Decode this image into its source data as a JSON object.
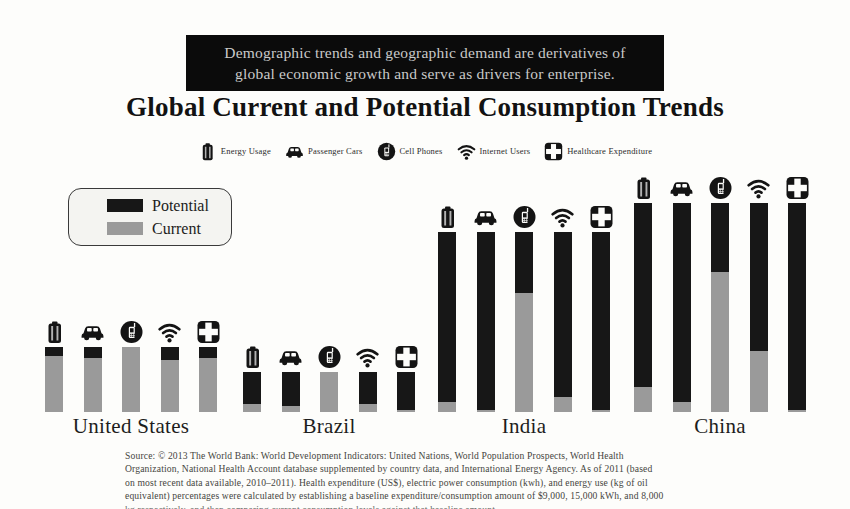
{
  "banner": {
    "line1": "Demographic trends and geographic demand are derivatives of",
    "line2": "global economic growth and serve as drivers for enterprise."
  },
  "title": "Global Current and Potential Consumption Trends",
  "icon_legend": {
    "items": [
      {
        "icon": "energy",
        "label": "Energy Usage"
      },
      {
        "icon": "car",
        "label": "Passenger Cars"
      },
      {
        "icon": "phone",
        "label": "Cell Phones"
      },
      {
        "icon": "wifi",
        "label": "Internet Users"
      },
      {
        "icon": "health",
        "label": "Healthcare Expenditure"
      }
    ]
  },
  "legend": {
    "items": [
      {
        "key": "potential",
        "label": "Potential",
        "color": "#171717"
      },
      {
        "key": "current",
        "label": "Current",
        "color": "#9a9a9a"
      }
    ]
  },
  "chart_data": {
    "type": "bar",
    "subtype": "grouped pictorial bars, each bar split into Current (gray, bottom) and Potential (black, top)",
    "title": "Global Current and Potential Consumption Trends",
    "categories": [
      "Energy Usage",
      "Passenger Cars",
      "Cell Phones",
      "Internet Users",
      "Healthcare Expenditure"
    ],
    "value_scale": "relative index, 0-100 (tallest bar = China = 100); no numeric axis shown in figure",
    "legend_position": "upper-left",
    "axes": "none (no gridlines, no tick labels)",
    "series_colors": {
      "potential": "#171717",
      "current": "#9a9a9a"
    },
    "groups": [
      {
        "label": "United States",
        "bars": [
          {
            "category": "Energy Usage",
            "total": 31,
            "current": 27
          },
          {
            "category": "Passenger Cars",
            "total": 31,
            "current": 26
          },
          {
            "category": "Cell Phones",
            "total": 31,
            "current": 31
          },
          {
            "category": "Internet Users",
            "total": 31,
            "current": 25
          },
          {
            "category": "Healthcare Expenditure",
            "total": 31,
            "current": 26
          }
        ]
      },
      {
        "label": "Brazil",
        "bars": [
          {
            "category": "Energy Usage",
            "total": 19,
            "current": 4
          },
          {
            "category": "Passenger Cars",
            "total": 19,
            "current": 3
          },
          {
            "category": "Cell Phones",
            "total": 19,
            "current": 19
          },
          {
            "category": "Internet Users",
            "total": 19,
            "current": 4
          },
          {
            "category": "Healthcare Expenditure",
            "total": 19,
            "current": 1
          }
        ]
      },
      {
        "label": "India",
        "bars": [
          {
            "category": "Energy Usage",
            "total": 86,
            "current": 5
          },
          {
            "category": "Passenger Cars",
            "total": 86,
            "current": 1
          },
          {
            "category": "Cell Phones",
            "total": 86,
            "current": 57
          },
          {
            "category": "Internet Users",
            "total": 86,
            "current": 7
          },
          {
            "category": "Healthcare Expenditure",
            "total": 86,
            "current": 1
          }
        ]
      },
      {
        "label": "China",
        "bars": [
          {
            "category": "Energy Usage",
            "total": 100,
            "current": 12
          },
          {
            "category": "Passenger Cars",
            "total": 100,
            "current": 5
          },
          {
            "category": "Cell Phones",
            "total": 100,
            "current": 67
          },
          {
            "category": "Internet Users",
            "total": 100,
            "current": 29
          },
          {
            "category": "Healthcare Expenditure",
            "total": 100,
            "current": 1
          }
        ]
      }
    ]
  },
  "source": {
    "line1": "Source: © 2013 The World Bank: World Development Indicators: United Nations, World Population Prospects, World Health",
    "line2": "Organization, National Health Account database supplemented by country data, and International Energy Agency. As of 2011 (based",
    "line3": "on most recent data available, 2010–2011).  Health expenditure (US$), electric power consumption (kwh), and energy use (kg of oil",
    "line4": "equivalent) percentages were calculated by establishing a baseline expenditure/consumption amount of $9,000, 15,000 kWh, and 8,000",
    "line5_clipped": "kg respectively, and then comparing current consumption levels against that baseline amount."
  }
}
